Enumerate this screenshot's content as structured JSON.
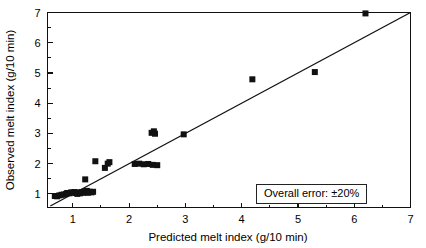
{
  "chart_data": {
    "type": "scatter",
    "title": "",
    "xlabel": "Predicted melt index (g/10 min)",
    "ylabel": "Observed melt index (g/10 min)",
    "xlim": [
      0.55,
      7
    ],
    "ylim": [
      0.55,
      7
    ],
    "grid": false,
    "legend": null,
    "xticks": [
      1,
      2,
      3,
      4,
      5,
      6,
      7
    ],
    "yticks": [
      1,
      2,
      3,
      4,
      5,
      6,
      7
    ],
    "xtick_labels": [
      "1",
      "2",
      "3",
      "4",
      "5",
      "6",
      "7"
    ],
    "ytick_labels": [
      "1",
      "2",
      "3",
      "4",
      "5",
      "6",
      "7"
    ],
    "minor_ticks_per_interval": 1,
    "marker": "square",
    "marker_color": "#111111",
    "marker_size_px": 6,
    "reference_line": {
      "name": "parity-line",
      "type": "y=x",
      "from": [
        0.6,
        0.6
      ],
      "to": [
        7.0,
        7.0
      ],
      "color": "#111111"
    },
    "annotation": {
      "text": "Overall error: ±20%",
      "x": 4.35,
      "y": 1.25,
      "boxed": true
    },
    "series": [
      {
        "name": "melt index parity data",
        "points": [
          [
            0.68,
            0.93
          ],
          [
            0.72,
            0.92
          ],
          [
            0.76,
            0.95
          ],
          [
            0.8,
            0.97
          ],
          [
            0.84,
            0.98
          ],
          [
            0.88,
            1.0
          ],
          [
            0.9,
            1.03
          ],
          [
            0.94,
            1.02
          ],
          [
            0.97,
            1.05
          ],
          [
            1.0,
            1.04
          ],
          [
            1.03,
            1.06
          ],
          [
            1.06,
            1.03
          ],
          [
            1.08,
            1.0
          ],
          [
            1.1,
            1.05
          ],
          [
            1.13,
            1.02
          ],
          [
            1.16,
            1.06
          ],
          [
            1.19,
            1.04
          ],
          [
            1.21,
            1.08
          ],
          [
            1.23,
            1.05
          ],
          [
            1.25,
            1.1
          ],
          [
            1.27,
            1.04
          ],
          [
            1.3,
            1.07
          ],
          [
            1.33,
            1.05
          ],
          [
            1.36,
            1.07
          ],
          [
            1.22,
            1.48
          ],
          [
            1.4,
            2.08
          ],
          [
            1.57,
            1.86
          ],
          [
            1.62,
            2.0
          ],
          [
            1.65,
            2.05
          ],
          [
            2.1,
            1.99
          ],
          [
            2.18,
            2.0
          ],
          [
            2.26,
            1.98
          ],
          [
            2.34,
            1.99
          ],
          [
            2.42,
            1.96
          ],
          [
            2.5,
            1.95
          ],
          [
            2.4,
            3.02
          ],
          [
            2.44,
            3.07
          ],
          [
            2.46,
            2.99
          ],
          [
            2.97,
            2.97
          ],
          [
            4.19,
            4.79
          ],
          [
            5.3,
            5.03
          ],
          [
            6.2,
            6.97
          ]
        ]
      }
    ]
  },
  "axes": {
    "x_title": "Predicted melt index (g/10 min)",
    "y_title": "Observed melt index (g/10 min)"
  },
  "annotation_box": {
    "label": "Overall error: ±20%"
  }
}
